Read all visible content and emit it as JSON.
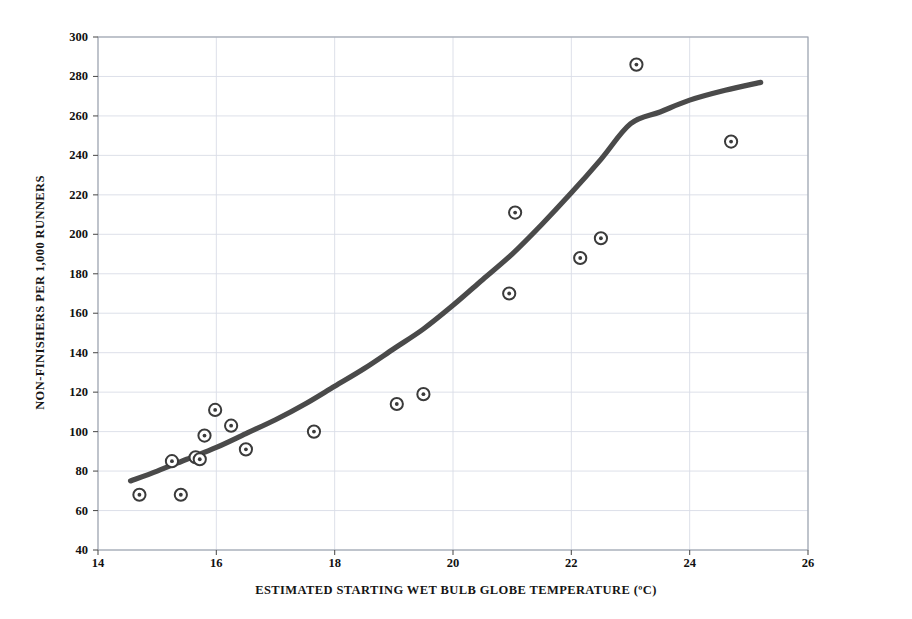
{
  "chart_data": {
    "type": "scatter",
    "title": "",
    "xlabel": "ESTIMATED STARTING WET BULB GLOBE TEMPERATURE (ºC)",
    "ylabel": "NON-FINISHERS PER 1,000 RUNNERS",
    "xlim": [
      14,
      26
    ],
    "ylim": [
      40,
      300
    ],
    "xticks": [
      14,
      16,
      18,
      20,
      22,
      24,
      26
    ],
    "yticks": [
      40,
      60,
      80,
      100,
      120,
      140,
      160,
      180,
      200,
      220,
      240,
      260,
      280,
      300
    ],
    "grid": true,
    "legend": "none",
    "marker_style": "open-circle-with-center-dot",
    "marker_color": "#3b3b3b",
    "curve_color": "#4a4a4a",
    "grid_color": "#d9dde6",
    "frame_color": "#9aa0ab",
    "background": "#ffffff",
    "points": [
      {
        "x": 14.7,
        "y": 68
      },
      {
        "x": 15.25,
        "y": 85
      },
      {
        "x": 15.4,
        "y": 68
      },
      {
        "x": 15.65,
        "y": 87
      },
      {
        "x": 15.72,
        "y": 86
      },
      {
        "x": 15.8,
        "y": 98
      },
      {
        "x": 15.98,
        "y": 111
      },
      {
        "x": 16.25,
        "y": 103
      },
      {
        "x": 16.5,
        "y": 91
      },
      {
        "x": 17.65,
        "y": 100
      },
      {
        "x": 19.05,
        "y": 114
      },
      {
        "x": 19.5,
        "y": 119
      },
      {
        "x": 20.95,
        "y": 170
      },
      {
        "x": 21.05,
        "y": 211
      },
      {
        "x": 22.15,
        "y": 188
      },
      {
        "x": 22.5,
        "y": 198
      },
      {
        "x": 23.1,
        "y": 286
      },
      {
        "x": 24.7,
        "y": 247
      }
    ],
    "fit_curve": {
      "name": "exponential-trend",
      "x_start": 14.55,
      "x_end": 25.2,
      "points": [
        {
          "x": 14.55,
          "y": 75
        },
        {
          "x": 15.0,
          "y": 80
        },
        {
          "x": 15.5,
          "y": 86
        },
        {
          "x": 16.0,
          "y": 92
        },
        {
          "x": 16.5,
          "y": 99
        },
        {
          "x": 17.0,
          "y": 106
        },
        {
          "x": 17.5,
          "y": 114
        },
        {
          "x": 18.0,
          "y": 123
        },
        {
          "x": 18.5,
          "y": 132
        },
        {
          "x": 19.0,
          "y": 142
        },
        {
          "x": 19.5,
          "y": 152
        },
        {
          "x": 20.0,
          "y": 164
        },
        {
          "x": 20.5,
          "y": 177
        },
        {
          "x": 21.0,
          "y": 190
        },
        {
          "x": 21.5,
          "y": 205
        },
        {
          "x": 22.0,
          "y": 221
        },
        {
          "x": 22.5,
          "y": 238
        },
        {
          "x": 23.0,
          "y": 256
        },
        {
          "x": 23.5,
          "y": 262
        },
        {
          "x": 24.0,
          "y": 268
        },
        {
          "x": 24.6,
          "y": 273
        },
        {
          "x": 25.2,
          "y": 277
        }
      ]
    }
  }
}
